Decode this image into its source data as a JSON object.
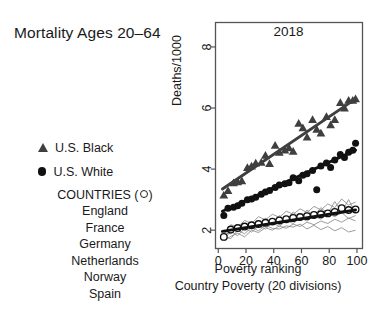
{
  "figure": {
    "headline": "Mortality Ages 20–64",
    "background": "#ffffff"
  },
  "legend": {
    "series": [
      {
        "marker": "filled-triangle",
        "label": "U.S. Black",
        "color": "#3f3f3f"
      },
      {
        "marker": "filled-circle",
        "label": "U.S. White",
        "color": "#111111"
      }
    ],
    "countries_header": "COUNTRIES (◦)",
    "countries_header_text": "COUNTRIES (",
    "countries_header_tail": ")",
    "countries": [
      "England",
      "France",
      "Germany",
      "Netherlands",
      "Norway",
      "Spain"
    ]
  },
  "chart_data": {
    "type": "scatter",
    "title": "2018",
    "xlabel": "Poverty ranking",
    "xsublabel": "Country Poverty (20 divisions)",
    "ylabel": "Deaths/1000",
    "xlim": [
      -2,
      104
    ],
    "ylim": [
      1.4,
      8.8
    ],
    "xticks": [
      0,
      20,
      40,
      60,
      80,
      100
    ],
    "yticks": [
      2,
      4,
      6,
      8
    ],
    "grid": false,
    "legend_position": "left-outside",
    "series": [
      {
        "name": "U.S. Black",
        "marker": "filled-triangle",
        "color": "#3f3f3f",
        "x": [
          4,
          7,
          11,
          14,
          17,
          21,
          24,
          27,
          31,
          34,
          37,
          41,
          44,
          48,
          51,
          54,
          58,
          61,
          64,
          68,
          71,
          74,
          78,
          81,
          84,
          88,
          91,
          94,
          97,
          99
        ],
        "y": [
          3.15,
          3.3,
          3.55,
          3.58,
          3.62,
          4.05,
          4.1,
          4.2,
          4.22,
          4.45,
          4.18,
          4.78,
          4.55,
          4.62,
          4.7,
          4.58,
          5.5,
          5.35,
          5.05,
          5.62,
          5.3,
          5.18,
          5.72,
          5.45,
          5.62,
          6.18,
          6.0,
          6.25,
          6.25,
          6.3
        ],
        "trend": {
          "type": "linear",
          "x": [
            3,
            99
          ],
          "y": [
            3.35,
            6.3
          ]
        }
      },
      {
        "name": "U.S. White",
        "marker": "filled-circle",
        "color": "#111111",
        "x": [
          4,
          7,
          11,
          14,
          17,
          21,
          24,
          27,
          31,
          34,
          37,
          41,
          44,
          48,
          51,
          54,
          58,
          61,
          64,
          68,
          71,
          74,
          78,
          81,
          84,
          88,
          91,
          94,
          97,
          99
        ],
        "y": [
          2.48,
          2.72,
          2.75,
          2.8,
          2.88,
          3.0,
          3.02,
          3.08,
          3.18,
          3.25,
          3.3,
          3.4,
          3.48,
          3.52,
          3.55,
          3.72,
          3.62,
          3.8,
          3.85,
          3.95,
          3.32,
          4.1,
          4.2,
          4.05,
          4.3,
          4.48,
          4.38,
          4.55,
          4.62,
          4.85
        ],
        "trend": {
          "type": "linear",
          "x": [
            3,
            99
          ],
          "y": [
            2.62,
            4.62
          ]
        }
      },
      {
        "name": "Countries (average)",
        "marker": "open-circle",
        "color": "#111111",
        "x": [
          4,
          9,
          14,
          19,
          24,
          29,
          34,
          39,
          44,
          49,
          54,
          59,
          64,
          69,
          74,
          79,
          84,
          89,
          94,
          99
        ],
        "y": [
          1.78,
          2.02,
          2.07,
          2.12,
          2.16,
          2.2,
          2.24,
          2.28,
          2.32,
          2.36,
          2.4,
          2.43,
          2.46,
          2.5,
          2.52,
          2.55,
          2.6,
          2.72,
          2.66,
          2.68
        ],
        "trend": {
          "type": "linear",
          "x": [
            3,
            99
          ],
          "y": [
            1.96,
            2.66
          ]
        }
      }
    ],
    "country_lines": [
      {
        "name": "England",
        "color": "#8a8a8a",
        "x": [
          4,
          9,
          14,
          19,
          24,
          29,
          34,
          39,
          44,
          49,
          54,
          59,
          64,
          69,
          74,
          79,
          84,
          89,
          94,
          99
        ],
        "y": [
          1.86,
          2.18,
          2.1,
          2.32,
          2.22,
          2.44,
          2.34,
          2.52,
          2.42,
          2.62,
          2.52,
          2.7,
          2.58,
          2.78,
          2.66,
          2.86,
          2.74,
          3.02,
          2.82,
          2.92
        ]
      },
      {
        "name": "France",
        "color": "#8a8a8a",
        "x": [
          4,
          9,
          14,
          19,
          24,
          29,
          34,
          39,
          44,
          49,
          54,
          59,
          64,
          69,
          74,
          79,
          84,
          89,
          94,
          99
        ],
        "y": [
          1.74,
          2.04,
          1.96,
          2.16,
          2.08,
          2.26,
          2.18,
          2.34,
          2.26,
          2.42,
          2.34,
          2.5,
          2.42,
          2.58,
          2.48,
          2.64,
          2.56,
          2.74,
          2.62,
          2.7
        ]
      },
      {
        "name": "Germany",
        "color": "#8a8a8a",
        "x": [
          4,
          9,
          14,
          19,
          24,
          29,
          34,
          39,
          44,
          49,
          54,
          59,
          64,
          69,
          74,
          79,
          84,
          89,
          94,
          99
        ],
        "y": [
          1.92,
          1.88,
          2.16,
          2.02,
          2.28,
          2.12,
          2.4,
          2.22,
          2.48,
          2.3,
          2.6,
          2.38,
          2.66,
          2.46,
          2.74,
          2.54,
          2.94,
          2.6,
          3.0,
          2.56
        ]
      },
      {
        "name": "Netherlands",
        "color": "#8a8a8a",
        "x": [
          4,
          9,
          14,
          19,
          24,
          29,
          34,
          39,
          44,
          49,
          54,
          59,
          64,
          69,
          74,
          79,
          84,
          89,
          94,
          99
        ],
        "y": [
          1.7,
          1.96,
          1.82,
          2.06,
          1.94,
          2.14,
          2.04,
          2.24,
          2.12,
          2.32,
          2.22,
          2.4,
          2.3,
          2.46,
          2.36,
          2.54,
          2.44,
          2.58,
          2.38,
          2.48
        ]
      },
      {
        "name": "Norway",
        "color": "#8a8a8a",
        "x": [
          4,
          9,
          14,
          19,
          24,
          29,
          34,
          39,
          44,
          49,
          54,
          59,
          64,
          69,
          74,
          79,
          84,
          89,
          94,
          99
        ],
        "y": [
          1.66,
          1.8,
          1.9,
          1.78,
          2.0,
          1.92,
          2.08,
          2.0,
          2.14,
          2.06,
          2.2,
          2.12,
          2.26,
          2.18,
          2.3,
          2.22,
          2.36,
          2.26,
          2.4,
          2.3
        ]
      },
      {
        "name": "Spain",
        "color": "#8a8a8a",
        "x": [
          4,
          9,
          14,
          19,
          24,
          29,
          34,
          39,
          44,
          49,
          54,
          59,
          64,
          69,
          74,
          79,
          84,
          89,
          94,
          99
        ],
        "y": [
          1.8,
          1.72,
          2.0,
          1.88,
          2.1,
          1.98,
          2.16,
          2.06,
          2.04,
          2.14,
          2.1,
          2.2,
          2.04,
          2.16,
          2.02,
          2.12,
          1.98,
          2.08,
          1.94,
          2.0
        ]
      }
    ]
  }
}
